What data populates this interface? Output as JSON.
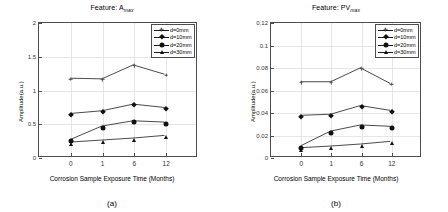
{
  "figure": {
    "panels": [
      {
        "caption": "(a)",
        "chart_data": {
          "type": "line",
          "title": "Feature: A",
          "title_subscript": "max",
          "title_full": "Feature: Amax",
          "xlabel": "Corrosion Sample Exposure Time (Months)",
          "ylabel": "Amplitude(a.u.)",
          "categories": [
            "0",
            "1",
            "6",
            "12"
          ],
          "x_tick_labels": [
            "0",
            "1",
            "6",
            "12"
          ],
          "y_tick_labels": [
            "0",
            "0.5",
            "1",
            "1.5",
            "2"
          ],
          "ylim": [
            0,
            2
          ],
          "yticks": [
            0,
            0.5,
            1,
            1.5,
            2
          ],
          "grid": true,
          "legend_position": "top-right",
          "series": [
            {
              "name": "d=0mm",
              "marker": "asterisk",
              "values": [
                1.17,
                1.16,
                1.37,
                1.23
              ]
            },
            {
              "name": "d=10mm",
              "marker": "diamond",
              "values": [
                0.64,
                0.68,
                0.78,
                0.73
              ]
            },
            {
              "name": "d=20mm",
              "marker": "circle",
              "values": [
                0.25,
                0.45,
                0.53,
                0.51
              ]
            },
            {
              "name": "d=30mm",
              "marker": "triangle",
              "values": [
                0.21,
                0.24,
                0.27,
                0.31
              ]
            }
          ]
        }
      },
      {
        "caption": "(b)",
        "chart_data": {
          "type": "line",
          "title": "Feature: PV",
          "title_subscript": "max",
          "title_full": "Feature: PVmax",
          "xlabel": "Corrosion Sample Exposure Time (Months)",
          "ylabel": "Amplitude(a.u.)",
          "categories": [
            "0",
            "1",
            "6",
            "12"
          ],
          "x_tick_labels": [
            "0",
            "1",
            "6",
            "12"
          ],
          "y_tick_labels": [
            "0",
            "0.02",
            "0.04",
            "0.06",
            "0.08",
            "0.1",
            "0.12"
          ],
          "ylim": [
            0,
            0.12
          ],
          "yticks": [
            0,
            0.02,
            0.04,
            0.06,
            0.08,
            0.1,
            0.12
          ],
          "grid": true,
          "legend_position": "top-right",
          "series": [
            {
              "name": "d=0mm",
              "marker": "asterisk",
              "values": [
                0.067,
                0.067,
                0.0795,
                0.0655
              ]
            },
            {
              "name": "d=10mm",
              "marker": "diamond",
              "values": [
                0.0367,
                0.0377,
                0.0455,
                0.0412
              ]
            },
            {
              "name": "d=20mm",
              "marker": "circle",
              "values": [
                0.0093,
                0.0225,
                0.028,
                0.0268
              ]
            },
            {
              "name": "d=30mm",
              "marker": "triangle",
              "values": [
                0.0075,
                0.009,
                0.0108,
                0.0132
              ]
            }
          ]
        }
      }
    ]
  },
  "colors": {
    "axis": "#4d4d4d",
    "grid": "#e6e6e6",
    "marker": "#111111",
    "line": "#1a1a1a"
  }
}
